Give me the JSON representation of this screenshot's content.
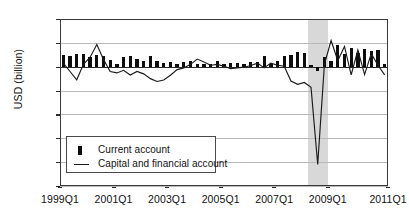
{
  "chart_data": {
    "type": "bar",
    "title": "",
    "xlabel": "",
    "ylabel": "USD (billion)",
    "ylim": [
      -50,
      20
    ],
    "ytick_values": [
      20,
      10,
      0,
      -10,
      -20,
      -30,
      -40,
      -50
    ],
    "ytick_labels": [
      "20",
      "10",
      "0",
      "-10",
      "-20",
      "-30",
      "-40",
      "-50"
    ],
    "grid": true,
    "legend_position": "lower left",
    "xtick_labels": [
      "1999Q1",
      "2001Q1",
      "2003Q1",
      "2005Q1",
      "2007Q1",
      "2009Q1",
      "2011Q1"
    ],
    "xtick_indices": [
      0,
      8,
      16,
      24,
      32,
      40,
      48
    ],
    "categories": [
      "1999Q1",
      "1999Q2",
      "1999Q3",
      "1999Q4",
      "2000Q1",
      "2000Q2",
      "2000Q3",
      "2000Q4",
      "2001Q1",
      "2001Q2",
      "2001Q3",
      "2001Q4",
      "2002Q1",
      "2002Q2",
      "2002Q3",
      "2002Q4",
      "2003Q1",
      "2003Q2",
      "2003Q3",
      "2003Q4",
      "2004Q1",
      "2004Q2",
      "2004Q3",
      "2004Q4",
      "2005Q1",
      "2005Q2",
      "2005Q3",
      "2005Q4",
      "2006Q1",
      "2006Q2",
      "2006Q3",
      "2006Q4",
      "2007Q1",
      "2007Q2",
      "2007Q3",
      "2007Q4",
      "2008Q1",
      "2008Q2",
      "2008Q3",
      "2008Q4",
      "2009Q1",
      "2009Q2",
      "2009Q3",
      "2009Q4",
      "2010Q1",
      "2010Q2",
      "2010Q3",
      "2010Q4",
      "2011Q1"
    ],
    "series": [
      {
        "name": "Current account",
        "type": "bar",
        "color": "#0d0d0d",
        "values": [
          5.0,
          4.6,
          5.4,
          5.2,
          4.0,
          5.0,
          4.3,
          3.0,
          1.2,
          4.2,
          4.6,
          3.2,
          2.4,
          4.3,
          2.6,
          1.5,
          2.0,
          1.1,
          1.9,
          2.2,
          1.2,
          1.0,
          1.0,
          2.4,
          1.1,
          1.4,
          1.5,
          1.1,
          1.8,
          2.0,
          4.4,
          1.2,
          2.6,
          4.5,
          5.1,
          6.3,
          5.6,
          0.6,
          -1.8,
          4.0,
          2.5,
          9.0,
          5.4,
          7.8,
          5.6,
          7.3,
          6.6,
          6.8,
          1.2
        ]
      },
      {
        "name": "Capital and financial account",
        "type": "line",
        "color": "#1a1a1a",
        "values": [
          1.5,
          -2.0,
          -5.5,
          1.0,
          4.0,
          9.3,
          3.0,
          -2.0,
          -2.6,
          -1.5,
          -3.5,
          -2.0,
          -3.0,
          -5.0,
          -6.2,
          -5.6,
          -3.6,
          -1.2,
          -0.5,
          1.0,
          3.2,
          2.0,
          0.6,
          1.0,
          0.2,
          -0.8,
          -0.5,
          -0.2,
          0.5,
          1.5,
          -0.5,
          1.5,
          0.6,
          0.2,
          -6.0,
          -7.4,
          -6.6,
          -8.6,
          -41.0,
          1.0,
          11.0,
          2.5,
          8.5,
          -3.4,
          7.0,
          -3.3,
          5.5,
          0.6,
          -3.4
        ]
      }
    ],
    "shaded_bands": [
      {
        "name": "recession-band",
        "start_index": 37,
        "end_index": 40,
        "color": "#c9c9c9"
      }
    ]
  },
  "legend": {
    "items": [
      {
        "label": "Current account",
        "marker": "bar-swatch"
      },
      {
        "label": "Capital and financial account",
        "marker": "line-swatch"
      }
    ]
  }
}
